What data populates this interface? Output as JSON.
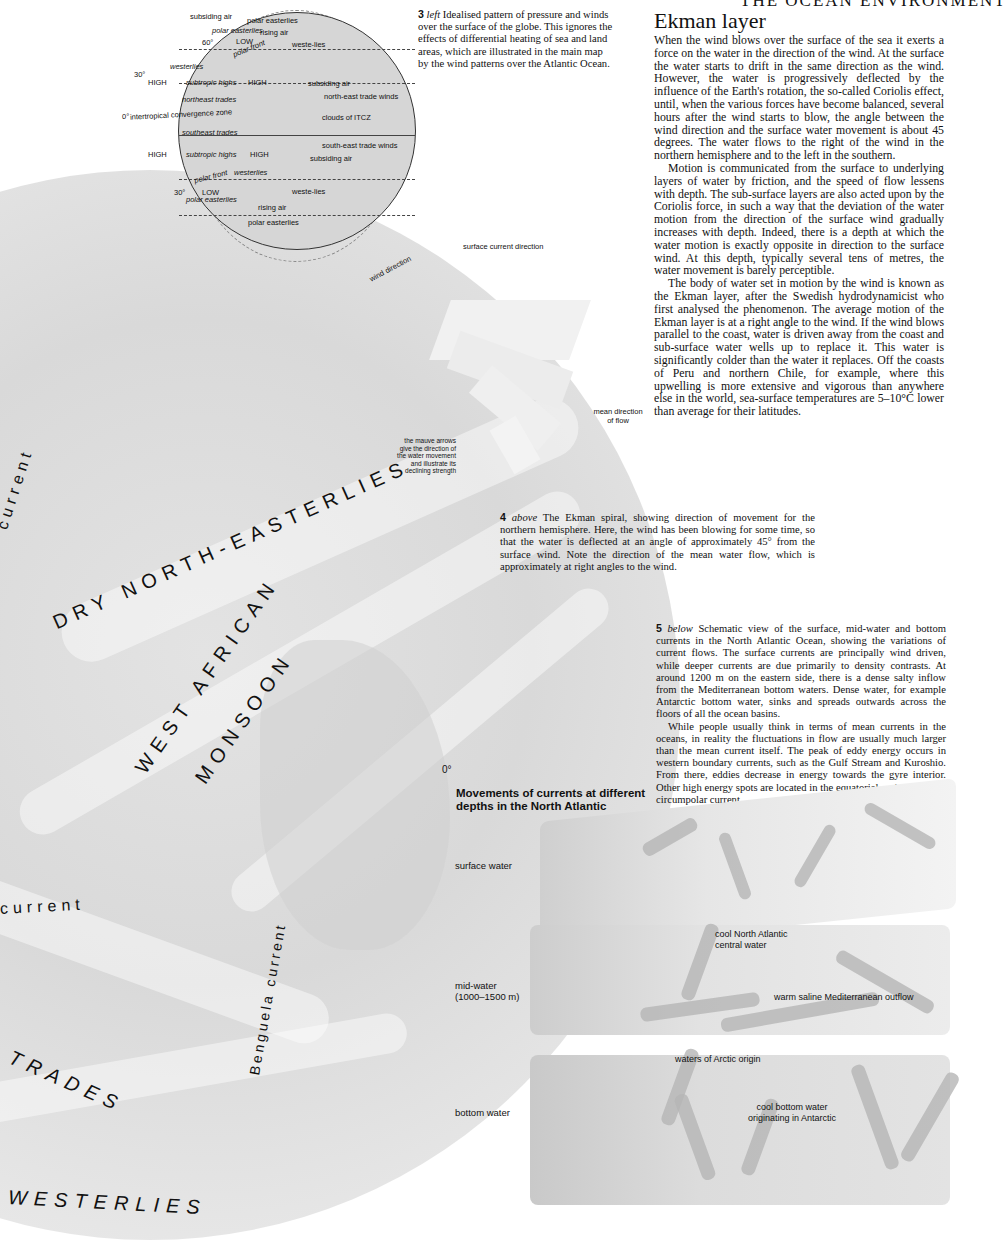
{
  "running_header": "THE OCEAN ENVIRONMENT",
  "figure3": {
    "globe_labels": {
      "polar_easterlies_top": "polar easterlies",
      "low_top": "LOW",
      "polar_front_top": "polar front",
      "lat_60_top": "60°",
      "westerlies_n": "westerlies",
      "lat_30_top": "30°",
      "subtropic_highs_n": "subtropic highs",
      "high_n_left": "HIGH",
      "high_n_right": "HIGH",
      "northeast_trades": "northeast trades",
      "itcz": "intertropical convergence zone",
      "lat_0": "0°",
      "southeast_trades": "southeast trades",
      "subtropic_highs_s": "subtropic highs",
      "high_s_left": "HIGH",
      "high_s_right": "HIGH",
      "lat_30_bottom": "30°",
      "polar_front_bottom": "polar front",
      "westerlies_s": "westerlies",
      "lat_60_bottom": "60°",
      "low_bottom": "LOW",
      "polar_easterlies_bottom": "polar easterlies"
    },
    "callouts": [
      "subsiding air",
      "polar easterlies",
      "rising air",
      "weste-lies",
      "subsiding air",
      "north-east trade winds",
      "clouds of ITCZ",
      "south-east trade winds",
      "subsiding air",
      "weste-lies",
      "rising air",
      "polar easterlies"
    ],
    "caption_num": "3",
    "caption_dir": "left",
    "caption_text": "Idealised pattern of pressure and winds over the surface of the globe. This ignores the effects of differential heating of sea and land areas, which are illustrated in the main map by the wind patterns over the Atlantic Ocean."
  },
  "article": {
    "heading": "Ekman layer",
    "paragraphs": [
      "When the wind blows over the surface of the sea it exerts a force on the water in the direction of the wind. At the surface the water starts to drift in the same direction as the wind. However, the water is progressively deflected by the influence of the Earth's rotation, the so-called Coriolis effect, until, when the various forces have become balanced, several hours after the wind starts to blow, the angle between the wind direction and the surface water movement is about 45 degrees. The water flows to the right of the wind in the northern hemisphere and to the left in the southern.",
      "Motion is communicated from the surface to underlying layers of water by friction, and the speed of flow lessens with depth. The sub-surface layers are also acted upon by the Coriolis force, in such a way that the deviation of the water motion from the direction of the surface wind gradually increases with depth. Indeed, there is a depth at which the water motion is exactly opposite in direction to the surface wind. At this depth, typically several tens of metres, the water movement is barely perceptible.",
      "The body of water set in motion by the wind is known as the Ekman layer, after the Swedish hydrodynamicist who first analysed the phenomenon. The average motion of the Ekman layer is at a right angle to the wind. If the wind blows parallel to the coast, water is driven away from the coast and sub-surface water wells up to replace it. This water is significantly colder than the water it replaces. Off the coasts of Peru and northern Chile, for example, where this upwelling is more extensive and vigorous than anywhere else in the world, sea-surface temperatures are 5–10°C lower than average for their latitudes."
    ]
  },
  "figure4": {
    "labels": {
      "wind_direction": "wind direction",
      "surface_current_direction": "surface current direction",
      "mean_direction": "mean direction",
      "of_flow": "of flow",
      "mauve_note": [
        "the mauve arrows",
        "give the direction of",
        "the water movement",
        "and illustrate its",
        "declining strength"
      ]
    },
    "caption_num": "4",
    "caption_dir": "above",
    "caption_text": "The Ekman spiral, showing direction of movement for the northern hemisphere. Here, the wind has been blowing for some time, so that the water is deflected at an angle of approximately 45° from the surface wind. Note the direction of the mean water flow, which is approximately at right angles to the wind."
  },
  "main_map": {
    "labels": {
      "current_top": "current",
      "dry_ne": "DRY NORTH-EASTERLIES",
      "west_african": "WEST AFRICAN",
      "monsoon": "MONSOON",
      "equator": "0°",
      "current_mid": "current",
      "benguela": "Benguela current",
      "trades": "TRADES",
      "westerlies": "WESTERLIES"
    }
  },
  "figure5": {
    "caption_num": "5",
    "caption_dir": "below",
    "caption_p1": "Schematic view of the surface, mid-water and bottom currents in the North Atlantic Ocean, showing the variations of current flows. The surface currents are principally wind driven, while deeper currents are due primarily to density contrasts. At around 1200 m on the eastern side, there is a dense salty inflow from the Mediterranean bottom waters. Dense water, for example Antarctic bottom water, sinks and spreads outwards across the floors of all the ocean basins.",
    "caption_p2": "While people usually think in terms of mean currents in the oceans, in reality the fluctuations in flow are usually much larger than the mean current itself. The peak of eddy energy occurs in western boundary currents, such as the Gulf Stream and Kuroshio. From there, eddies decrease in energy towards the gyre interior. Other high energy spots are located in the equatorial regions and the circumpolar current.",
    "diagram_title": "Movements of currents at different depths in the North Atlantic",
    "layers": {
      "surface": "surface water",
      "mid": "mid-water",
      "mid_depth": "(1000–1500 m)",
      "bottom": "bottom water"
    },
    "annotations": {
      "cool_na_1": "cool North Atlantic",
      "cool_na_2": "central water",
      "med_outflow": "warm saline Mediterranean outflow",
      "arctic": "waters of Arctic origin",
      "antarctic_1": "cool bottom water",
      "antarctic_2": "originating in Antarctic"
    }
  }
}
